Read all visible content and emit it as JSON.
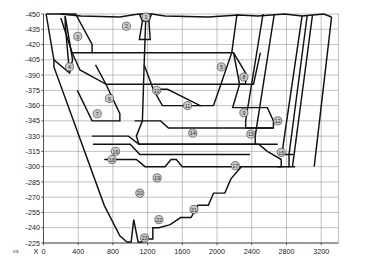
{
  "figure": {
    "kind": "geological-cross-section",
    "background": "#ffffff",
    "line_color": "#111111",
    "grid_color": "#8e8e8e",
    "marker_fill": "#c9c9c9",
    "marker_stroke": "#4a4a4a"
  },
  "chart_data": {
    "type": "line",
    "title": "",
    "xlabel": "X",
    "ylabel": "",
    "grid": true,
    "legend": "none",
    "xlim": [
      0,
      3400
    ],
    "ylim": [
      -450,
      -225
    ],
    "x_ticks": [
      0,
      400,
      800,
      1200,
      1600,
      2000,
      2400,
      2800,
      3200
    ],
    "x_tick_labels": [
      "0",
      "400",
      "800",
      "1200",
      "1600",
      "2000",
      "2400",
      "2800",
      "3200"
    ],
    "y_ticks": [
      -450,
      -435,
      -420,
      -405,
      -390,
      -375,
      -360,
      -345,
      -330,
      -315,
      -300,
      -285,
      -270,
      -255,
      -240,
      -225
    ],
    "y_tick_labels": [
      "-450",
      "-435",
      "-420",
      "-405",
      "-390",
      "-375",
      "-360",
      "-345",
      "-330",
      "-315",
      "-300",
      "-285",
      "-270",
      "-255",
      "-240",
      "-225"
    ],
    "axis_origin_label": "X",
    "annotations": [
      {
        "id": "1",
        "x": 1180,
        "y": -447
      },
      {
        "id": "2",
        "x": 955,
        "y": -438
      },
      {
        "id": "3",
        "x": 395,
        "y": -428
      },
      {
        "id": "4",
        "x": 300,
        "y": -398
      },
      {
        "id": "5",
        "x": 2050,
        "y": -398
      },
      {
        "id": "6",
        "x": 760,
        "y": -367
      },
      {
        "id": "7",
        "x": 620,
        "y": -352
      },
      {
        "id": "8",
        "x": 2310,
        "y": -388
      },
      {
        "id": "9",
        "x": 2310,
        "y": -353
      },
      {
        "id": "10",
        "x": 1305,
        "y": -375
      },
      {
        "id": "11",
        "x": 1660,
        "y": -360
      },
      {
        "id": "12",
        "x": 2700,
        "y": -345
      },
      {
        "id": "13",
        "x": 2390,
        "y": -332
      },
      {
        "id": "14",
        "x": 1720,
        "y": -333
      },
      {
        "id": "15",
        "x": 2740,
        "y": -314
      },
      {
        "id": "16",
        "x": 830,
        "y": -315
      },
      {
        "id": "17",
        "x": 2210,
        "y": -301
      },
      {
        "id": "18",
        "x": 790,
        "y": -307
      },
      {
        "id": "19",
        "x": 1310,
        "y": -289
      },
      {
        "id": "20",
        "x": 1110,
        "y": -274
      },
      {
        "id": "21",
        "x": 1735,
        "y": -258
      },
      {
        "id": "22",
        "x": 1330,
        "y": -248
      },
      {
        "id": "23",
        "x": 1165,
        "y": -230
      }
    ],
    "series": [
      {
        "name": "ground-surface",
        "points": [
          [
            30,
            -450
          ],
          [
            190,
            -450
          ],
          [
            430,
            -448
          ],
          [
            880,
            -447
          ],
          [
            1020,
            -449
          ],
          [
            1100,
            -450
          ],
          [
            1250,
            -450
          ],
          [
            1400,
            -448
          ],
          [
            1900,
            -447
          ],
          [
            2250,
            -449
          ],
          [
            2470,
            -448
          ],
          [
            2780,
            -450
          ],
          [
            2980,
            -448
          ],
          [
            3230,
            -450
          ],
          [
            3320,
            -447
          ]
        ]
      },
      {
        "name": "pit-outline-left",
        "points": [
          [
            30,
            -450
          ],
          [
            120,
            -405
          ],
          [
            300,
            -392
          ],
          [
            335,
            -405
          ],
          [
            250,
            -448
          ]
        ]
      },
      {
        "name": "bench-3",
        "points": [
          [
            195,
            -450
          ],
          [
            370,
            -450
          ],
          [
            560,
            -420
          ],
          [
            560,
            -412
          ],
          [
            330,
            -412
          ],
          [
            200,
            -446
          ]
        ]
      },
      {
        "name": "bench-5",
        "points": [
          [
            560,
            -412
          ],
          [
            2190,
            -412
          ],
          [
            2330,
            -392
          ],
          [
            2330,
            -381
          ],
          [
            720,
            -381
          ],
          [
            600,
            -400
          ]
        ]
      },
      {
        "name": "bench-6-7",
        "points": [
          [
            330,
            -412
          ],
          [
            420,
            -395
          ],
          [
            720,
            -381
          ],
          [
            880,
            -352
          ],
          [
            880,
            -345
          ],
          [
            560,
            -345
          ],
          [
            390,
            -375
          ]
        ]
      },
      {
        "name": "bench-wedge-8",
        "points": [
          [
            2190,
            -412
          ],
          [
            2260,
            -381
          ],
          [
            2420,
            -381
          ],
          [
            2500,
            -412
          ]
        ]
      },
      {
        "name": "bench-9-12",
        "points": [
          [
            2260,
            -381
          ],
          [
            2180,
            -358
          ],
          [
            2580,
            -358
          ],
          [
            2650,
            -345
          ],
          [
            2650,
            -338
          ],
          [
            2060,
            -338
          ]
        ]
      },
      {
        "name": "inner-pit-10-11",
        "points": [
          [
            1180,
            -450
          ],
          [
            1160,
            -400
          ],
          [
            1265,
            -376
          ],
          [
            1430,
            -376
          ],
          [
            1805,
            -360
          ],
          [
            1960,
            -360
          ],
          [
            2170,
            -412
          ],
          [
            2230,
            -450
          ]
        ]
      },
      {
        "name": "bench-11-flat",
        "points": [
          [
            1265,
            -376
          ],
          [
            1370,
            -360
          ],
          [
            1820,
            -360
          ]
        ]
      },
      {
        "name": "bench-13-14",
        "points": [
          [
            2060,
            -338
          ],
          [
            1440,
            -338
          ],
          [
            1350,
            -345
          ],
          [
            1050,
            -345
          ]
        ]
      },
      {
        "name": "layer-14-bottom",
        "points": [
          [
            1160,
            -400
          ],
          [
            1140,
            -345
          ],
          [
            1070,
            -330
          ],
          [
            1100,
            -322
          ],
          [
            2480,
            -322
          ],
          [
            2580,
            -315
          ]
        ]
      },
      {
        "name": "layer-15",
        "points": [
          [
            2580,
            -315
          ],
          [
            2740,
            -307
          ],
          [
            2740,
            -300
          ],
          [
            2700,
            -300
          ]
        ]
      },
      {
        "name": "bench-16-18",
        "points": [
          [
            560,
            -330
          ],
          [
            980,
            -330
          ],
          [
            1100,
            -322
          ],
          [
            2450,
            -322
          ]
        ]
      },
      {
        "name": "bench-17",
        "points": [
          [
            700,
            -307
          ],
          [
            1070,
            -307
          ],
          [
            1170,
            -300
          ],
          [
            1400,
            -300
          ],
          [
            1470,
            -307
          ],
          [
            1530,
            -307
          ],
          [
            1600,
            -300
          ],
          [
            2830,
            -300
          ]
        ]
      },
      {
        "name": "bench-16-top",
        "points": [
          [
            570,
            -322
          ],
          [
            1000,
            -322
          ],
          [
            1110,
            -312
          ],
          [
            2380,
            -312
          ]
        ]
      },
      {
        "name": "pit-floor-left-diagonal",
        "points": [
          [
            120,
            -405
          ],
          [
            120,
            -398
          ],
          [
            700,
            -262
          ],
          [
            880,
            -232
          ],
          [
            960,
            -226
          ]
        ]
      },
      {
        "name": "pit-floor-20-23",
        "points": [
          [
            960,
            -226
          ],
          [
            1010,
            -226
          ],
          [
            1040,
            -248
          ],
          [
            1090,
            -226
          ],
          [
            1135,
            -226
          ],
          [
            1135,
            -229
          ],
          [
            1260,
            -229
          ],
          [
            1260,
            -240
          ],
          [
            1330,
            -240
          ],
          [
            1460,
            -243
          ],
          [
            1580,
            -250
          ],
          [
            1700,
            -250
          ],
          [
            1780,
            -262
          ],
          [
            1900,
            -262
          ],
          [
            1960,
            -274
          ],
          [
            2090,
            -274
          ],
          [
            2160,
            -288
          ],
          [
            2280,
            -300
          ]
        ]
      },
      {
        "name": "right-wall-1",
        "points": [
          [
            2530,
            -450
          ],
          [
            2330,
            -345
          ],
          [
            2330,
            -338
          ],
          [
            2650,
            -338
          ]
        ]
      },
      {
        "name": "right-wall-2",
        "points": [
          [
            2660,
            -450
          ],
          [
            2440,
            -330
          ],
          [
            2440,
            -322
          ],
          [
            2700,
            -322
          ]
        ]
      },
      {
        "name": "right-wall-3",
        "points": [
          [
            2980,
            -448
          ],
          [
            2760,
            -320
          ],
          [
            2760,
            -312
          ],
          [
            2880,
            -312
          ]
        ]
      },
      {
        "name": "right-wall-4",
        "points": [
          [
            3040,
            -449
          ],
          [
            2830,
            -312
          ],
          [
            2830,
            -300
          ],
          [
            2900,
            -300
          ]
        ]
      },
      {
        "name": "right-wall-5",
        "points": [
          [
            3100,
            -449
          ],
          [
            2870,
            -300
          ]
        ]
      },
      {
        "name": "right-wall-outer",
        "points": [
          [
            3320,
            -447
          ],
          [
            3120,
            -300
          ]
        ]
      },
      {
        "name": "left-inner-wedge",
        "points": [
          [
            250,
            -448
          ],
          [
            250,
            -440
          ],
          [
            300,
            -392
          ]
        ]
      },
      {
        "name": "inner-notch-1",
        "points": [
          [
            1105,
            -450
          ],
          [
            1140,
            -443
          ],
          [
            1215,
            -443
          ],
          [
            1245,
            -450
          ]
        ]
      },
      {
        "name": "inner-notch-2",
        "points": [
          [
            1140,
            -443
          ],
          [
            1105,
            -425
          ],
          [
            1230,
            -425
          ],
          [
            1215,
            -443
          ]
        ]
      }
    ]
  },
  "axis_marker": {
    "arrow_glyph": "⇨",
    "x_letter": "X"
  }
}
